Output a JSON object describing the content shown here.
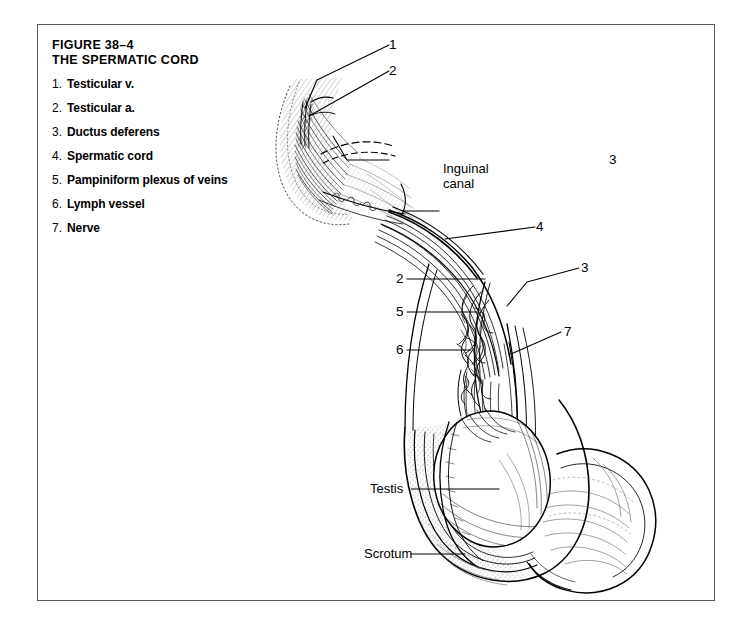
{
  "figure": {
    "number_label": "FIGURE 38–4",
    "title": "THE SPERMATIC CORD",
    "legend": [
      {
        "num": "1.",
        "label": "Testicular v."
      },
      {
        "num": "2.",
        "label": "Testicular a."
      },
      {
        "num": "3.",
        "label": "Ductus deferens"
      },
      {
        "num": "4.",
        "label": "Spermatic cord"
      },
      {
        "num": "5.",
        "label": "Pampiniform plexus of veins"
      },
      {
        "num": "6.",
        "label": "Lymph vessel"
      },
      {
        "num": "7.",
        "label": "Nerve"
      }
    ],
    "callouts": [
      {
        "id": "callout-1",
        "text": "1",
        "kind": "num"
      },
      {
        "id": "callout-2-top",
        "text": "2",
        "kind": "num"
      },
      {
        "id": "callout-3-top",
        "text": "3",
        "kind": "num"
      },
      {
        "id": "callout-4",
        "text": "4",
        "kind": "num"
      },
      {
        "id": "callout-3-mid",
        "text": "3",
        "kind": "num"
      },
      {
        "id": "callout-2-mid",
        "text": "2",
        "kind": "num"
      },
      {
        "id": "callout-5",
        "text": "5",
        "kind": "num"
      },
      {
        "id": "callout-6",
        "text": "6",
        "kind": "num"
      },
      {
        "id": "callout-7",
        "text": "7",
        "kind": "num"
      }
    ],
    "text_labels": {
      "inguinal_canal_line1": "Inguinal",
      "inguinal_canal_line2": "canal",
      "testis": "Testis",
      "scrotum": "Scrotum"
    },
    "colors": {
      "ink": "#000000",
      "frame": "#5a5a5a",
      "paper": "#ffffff",
      "hatch": "#2b2b2b"
    }
  }
}
